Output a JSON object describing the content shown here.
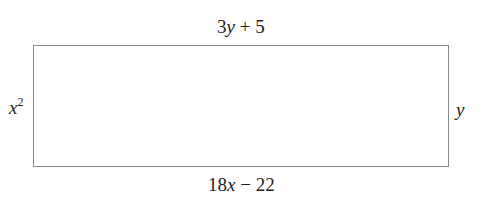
{
  "diagram": {
    "shape": "rectangle",
    "sides": {
      "top": {
        "coef": "3",
        "var": "y",
        "op": " + ",
        "const": "5"
      },
      "bottom": {
        "coef": "18",
        "var": "x",
        "op": " − ",
        "const": "22"
      },
      "left": {
        "var": "x",
        "exp": "2"
      },
      "right": {
        "var": "y"
      }
    },
    "colors": {
      "stroke": "#8a8a8a",
      "text": "#222222",
      "background": "#ffffff"
    }
  }
}
